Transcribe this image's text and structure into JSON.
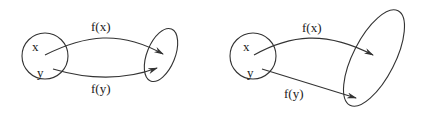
{
  "diagrams": [
    {
      "id": "left",
      "domain_labels": [
        "x",
        "y"
      ],
      "arrow_labels": [
        "f(x)",
        "f(y)"
      ]
    },
    {
      "id": "right",
      "domain_labels": [
        "x",
        "y"
      ],
      "arrow_labels": [
        "f(x)",
        "f(y)"
      ]
    }
  ],
  "colors": {
    "stroke": "#333333",
    "background": "#ffffff"
  }
}
